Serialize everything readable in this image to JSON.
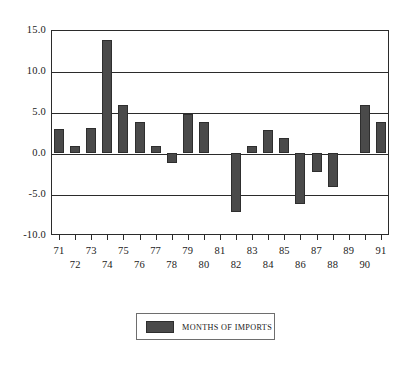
{
  "chart_data": {
    "type": "bar",
    "title": "",
    "subtitle": "",
    "xlabel": "",
    "ylabel": "",
    "categories": [
      "71",
      "72",
      "73",
      "74",
      "75",
      "76",
      "77",
      "78",
      "79",
      "80",
      "81",
      "82",
      "83",
      "84",
      "85",
      "86",
      "87",
      "88",
      "89",
      "90",
      "91"
    ],
    "values": [
      2.9,
      0.9,
      3.0,
      13.8,
      5.8,
      3.8,
      0.9,
      -1.2,
      4.8,
      3.8,
      0.0,
      -7.2,
      0.8,
      2.8,
      1.8,
      -6.2,
      -2.3,
      -4.2,
      0.0,
      5.8,
      3.8
    ],
    "series": [
      {
        "name": "MONTHS OF IMPORTS",
        "color": "#4a4a4a",
        "values": [
          2.9,
          0.9,
          3.0,
          13.8,
          5.8,
          3.8,
          0.9,
          -1.2,
          4.8,
          3.8,
          0.0,
          -7.2,
          0.8,
          2.8,
          1.8,
          -6.2,
          -2.3,
          -4.2,
          0.0,
          5.8,
          3.8
        ]
      }
    ],
    "ylim": [
      -10.0,
      15.0
    ],
    "yticks": [
      15.0,
      10.0,
      5.0,
      0.0,
      -5.0,
      -10.0
    ],
    "ytick_labels": [
      "15.0",
      "10.0",
      "5.0",
      "0.0",
      "-5.0",
      "-10.0"
    ],
    "xtick_labels_top": [
      "71",
      "73",
      "75",
      "77",
      "79",
      "81",
      "83",
      "85",
      "87",
      "89",
      "91"
    ],
    "xtick_labels_bottom": [
      "72",
      "74",
      "76",
      "78",
      "80",
      "82",
      "84",
      "86",
      "88",
      "90"
    ],
    "grid": true,
    "grid_axis": "y",
    "legend": {
      "position": "bottom",
      "entries": [
        {
          "label": "MONTHS OF IMPORTS",
          "color": "#4a4a4a"
        }
      ]
    }
  },
  "legend": {
    "label": "MONTHS OF IMPORTS"
  },
  "colors": {
    "bar": "#4a4a4a",
    "bar_edge": "#2e2e2e",
    "axis": "#2b2b2b",
    "background": "#ffffff",
    "legend_border": "#6e6e6e"
  }
}
